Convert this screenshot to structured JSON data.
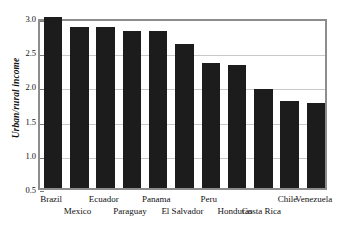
{
  "chart_data": {
    "type": "bar",
    "title": "",
    "xlabel": "",
    "ylabel": "Urban/rural income",
    "ylim": [
      0.5,
      3.0
    ],
    "ytick_labels": [
      "0.5",
      "1.0",
      "1.5",
      "2.0",
      "2.5",
      "3.0"
    ],
    "ytick_values": [
      0.5,
      1.0,
      1.5,
      2.0,
      2.5,
      3.0
    ],
    "grid": true,
    "legend": "none",
    "bar_color": "#1c1c1c",
    "frame_color": "#8d8d8d",
    "gridline_color": "#c9c9c9",
    "label_rows": 2,
    "categories": [
      "Brazil",
      "Mexico",
      "Ecuador",
      "Paraguay",
      "Panama",
      "El Salvador",
      "Peru",
      "Honduras",
      "Costa Rica",
      "Chile",
      "Venezuela"
    ],
    "values": [
      3.0,
      2.86,
      2.85,
      2.79,
      2.79,
      2.61,
      2.33,
      2.3,
      1.95,
      1.77,
      1.75
    ],
    "label_row_index": [
      0,
      1,
      0,
      1,
      0,
      1,
      0,
      1,
      1,
      0,
      0
    ]
  }
}
